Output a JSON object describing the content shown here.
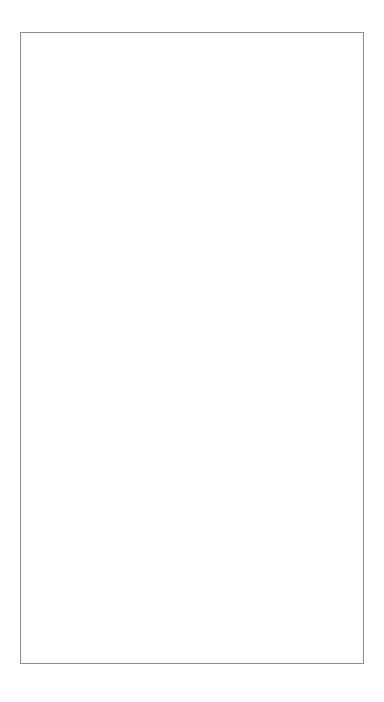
{
  "page": {
    "background_color": "#ffffff",
    "orientation": "landscape-sheet-rotated-90ccw",
    "border_color": "#8b8b8e",
    "circle_stroke_color": "#6f6f73",
    "text_color": "#2b2b2e"
  },
  "worksheet": {
    "title": "",
    "bubbles": [
      {
        "id": "strengths-values-goals",
        "lines": [
          "Strengths,",
          "Values, Goals"
        ],
        "label": "Strengths, Values, Goals",
        "empty": false,
        "cx": 80,
        "cy": 102,
        "r": 46
      },
      {
        "id": "managing-stress-anxiety",
        "lines": [
          "Managing",
          "Stress/Anxiety"
        ],
        "label": "Managing Stress/Anxiety",
        "empty": false,
        "cx": 275,
        "cy": 89,
        "r": 47
      },
      {
        "id": "relationships",
        "lines": [
          "Relationships"
        ],
        "label": "Relationships",
        "empty": false,
        "cx": 182,
        "cy": 201,
        "r": 47
      },
      {
        "id": "medications",
        "lines": [
          "Medications"
        ],
        "label": "Medications",
        "empty": false,
        "cx": 289,
        "cy": 252,
        "r": 47
      },
      {
        "id": "blank-upper-left",
        "lines": [],
        "label": "",
        "empty": true,
        "cx": 84,
        "cy": 336,
        "r": 44
      },
      {
        "id": "staying-healthy",
        "lines": [
          "Staying",
          "Healthy"
        ],
        "label": "Staying Healthy",
        "empty": false,
        "cx": 175,
        "cy": 425,
        "r": 46
      },
      {
        "id": "feeling-happy-hopeful",
        "lines": [
          "Feeling",
          "Happy/Hopeful"
        ],
        "label": "Feeling Happy/Hopeful",
        "empty": false,
        "cx": 307,
        "cy": 422,
        "r": 45
      },
      {
        "id": "whats-working-well",
        "lines": [
          "What's",
          "Working Well"
        ],
        "label": "What's Working Well",
        "empty": false,
        "cx": 241,
        "cy": 582,
        "r": 46
      },
      {
        "id": "blank-lower-left",
        "lines": [],
        "label": "",
        "empty": true,
        "cx": 129,
        "cy": 602,
        "r": 47
      }
    ]
  }
}
